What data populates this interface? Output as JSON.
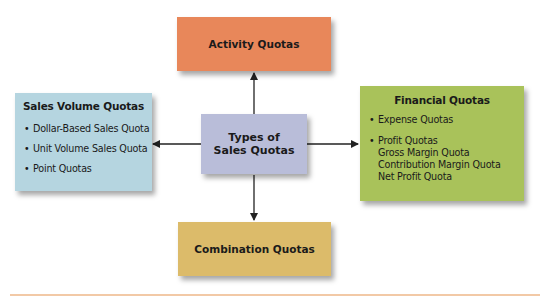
{
  "diagram": {
    "center": {
      "line1": "Types of",
      "line2": "Sales Quotas",
      "color": "#b9bdd9"
    },
    "top": {
      "title": "Activity Quotas",
      "color": "#e8875a"
    },
    "bottom": {
      "title": "Combination Quotas",
      "color": "#dcbb6a"
    },
    "left": {
      "title": "Sales Volume Quotas",
      "color": "#b5d5e0",
      "items": [
        "Dollar-Based Sales Quota",
        "Unit Volume Sales Quota",
        "Point Quotas"
      ]
    },
    "right": {
      "title": "Financial Quotas",
      "color": "#a9c25a",
      "items": [
        "Expense Quotas",
        "Profit Quotas"
      ],
      "sub_items": [
        "Gross Margin Quota",
        "Contribution Margin Quota",
        "Net Profit Quota"
      ]
    },
    "footer_rule_color": "#f2c9a6"
  }
}
